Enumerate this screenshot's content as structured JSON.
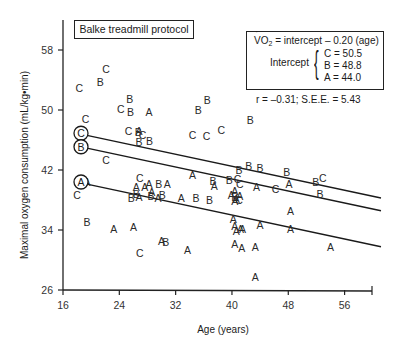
{
  "chart_data": {
    "type": "scatter",
    "title": "Balke treadmill protocol",
    "xlabel": "Age (years)",
    "ylabel": "Maximal oxygen consumption (mL/kg•min)",
    "xlim": [
      16,
      60
    ],
    "ylim": [
      26,
      62
    ],
    "x_ticks": [
      16,
      24,
      32,
      40,
      48,
      56
    ],
    "y_ticks": [
      26,
      34,
      42,
      50,
      58
    ],
    "grid": false,
    "legend_position": "none (letters mark groups A, B, C)",
    "equation": {
      "line1_prefix": "VO",
      "line1_sub": "2",
      "line1_suffix": " = intercept – 0.20 (age)",
      "intercept_label": "Intercept",
      "intercepts": [
        "C = 50.5",
        "B = 48.8",
        "A = 44.0"
      ]
    },
    "stats_text": "r = –0.31; S.E.E. = 5.43",
    "regression_lines": [
      {
        "name": "C",
        "intercept": 50.5,
        "slope": -0.2,
        "x_range": [
          19.4,
          60
        ]
      },
      {
        "name": "B",
        "intercept": 48.8,
        "slope": -0.2,
        "x_range": [
          19.4,
          60
        ]
      },
      {
        "name": "A",
        "intercept": 44.0,
        "slope": -0.2,
        "x_range": [
          19.4,
          60
        ]
      }
    ],
    "line_markers": [
      {
        "label": "C",
        "x": 18.5,
        "y": 46.9
      },
      {
        "label": "B",
        "x": 18.5,
        "y": 45.1
      },
      {
        "label": "A",
        "x": 18.5,
        "y": 40.4
      }
    ],
    "series": [
      {
        "name": "A",
        "points": [
          [
            28.2,
            49.7
          ],
          [
            26.8,
            47.2
          ],
          [
            34.4,
            41.3
          ],
          [
            28.2,
            40.1
          ],
          [
            27.6,
            39.8
          ],
          [
            30.8,
            40.1
          ],
          [
            26.4,
            39.8
          ],
          [
            28.6,
            39.1
          ],
          [
            26.8,
            38.4
          ],
          [
            29.5,
            38.3
          ],
          [
            32.8,
            38.3
          ],
          [
            37.5,
            39.9
          ],
          [
            39.9,
            38.7
          ],
          [
            40.4,
            39.2
          ],
          [
            40.4,
            37.9
          ],
          [
            40.6,
            38.1
          ],
          [
            41.1,
            38.6
          ],
          [
            43.5,
            39.8
          ],
          [
            48.1,
            40.2
          ],
          [
            23.2,
            34.1
          ],
          [
            26.0,
            34.4
          ],
          [
            30.0,
            32.5
          ],
          [
            33.7,
            31.3
          ],
          [
            40.2,
            35.5
          ],
          [
            40.4,
            34.6
          ],
          [
            40.6,
            33.9
          ],
          [
            41.2,
            34.2
          ],
          [
            41.5,
            34.1
          ],
          [
            44.0,
            34.7
          ],
          [
            40.4,
            32.1
          ],
          [
            41.4,
            31.6
          ],
          [
            43.3,
            31.7
          ],
          [
            48.3,
            36.6
          ],
          [
            48.3,
            34.1
          ],
          [
            54.0,
            31.7
          ],
          [
            43.3,
            27.8
          ],
          [
            19.4,
            40.4
          ]
        ]
      },
      {
        "name": "B",
        "points": [
          [
            21.3,
            53.7
          ],
          [
            25.5,
            51.5
          ],
          [
            25.6,
            49.7
          ],
          [
            26.7,
            47.1
          ],
          [
            26.8,
            45.8
          ],
          [
            28.3,
            45.9
          ],
          [
            36.5,
            51.4
          ],
          [
            35.2,
            50.0
          ],
          [
            42.6,
            48.7
          ],
          [
            42.4,
            42.6
          ],
          [
            29.6,
            40.2
          ],
          [
            37.3,
            40.5
          ],
          [
            39.6,
            40.7
          ],
          [
            25.7,
            38.3
          ],
          [
            26.4,
            38.8
          ],
          [
            28.5,
            38.6
          ],
          [
            30.1,
            38.7
          ],
          [
            34.9,
            38.3
          ],
          [
            36.8,
            38.0
          ],
          [
            40.4,
            38.4
          ],
          [
            47.8,
            41.8
          ],
          [
            51.9,
            40.4
          ],
          [
            52.5,
            38.8
          ],
          [
            30.6,
            32.4
          ],
          [
            19.4,
            35.1
          ],
          [
            41.0,
            42.0
          ],
          [
            44.0,
            42.3
          ],
          [
            18.6,
            45.1
          ]
        ]
      },
      {
        "name": "C",
        "points": [
          [
            18.3,
            53.0
          ],
          [
            22.1,
            55.5
          ],
          [
            24.2,
            50.1
          ],
          [
            19.2,
            48.8
          ],
          [
            25.3,
            47.2
          ],
          [
            27.3,
            46.7
          ],
          [
            22.1,
            43.3
          ],
          [
            34.4,
            46.7
          ],
          [
            36.4,
            46.6
          ],
          [
            38.5,
            47.4
          ],
          [
            26.9,
            41.0
          ],
          [
            40.8,
            40.8
          ],
          [
            41.1,
            40.2
          ],
          [
            46.2,
            39.5
          ],
          [
            52.9,
            41.0
          ],
          [
            41.0,
            38.0
          ],
          [
            18.0,
            38.7
          ],
          [
            26.9,
            31.0
          ],
          [
            18.6,
            46.9
          ]
        ]
      }
    ]
  }
}
